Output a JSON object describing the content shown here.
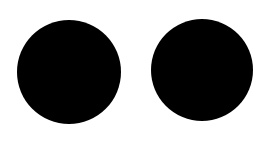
{
  "background": "#ffffff",
  "shapes": [
    {
      "name": "left-circle",
      "cx": 69,
      "cy": 72,
      "r": 52,
      "color": "#000000"
    },
    {
      "name": "right-circle",
      "cx": 202,
      "cy": 70,
      "r": 51,
      "color": "#000000"
    }
  ]
}
